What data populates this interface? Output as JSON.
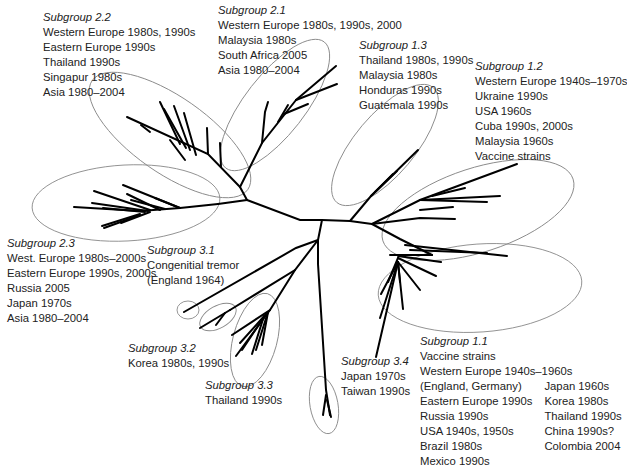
{
  "diagram": {
    "type": "unrooted phylogenetic tree",
    "subgroups": {
      "sg22": {
        "title": "Subgroup 2.2",
        "lines": [
          "Western Europe 1980s, 1990s",
          "Eastern Europe 1990s",
          "Thailand 1990s",
          "Singapur 1980s",
          "Asia 1980–2004"
        ]
      },
      "sg21": {
        "title": "Subgroup 2.1",
        "lines": [
          "Western Europe 1980s, 1990s, 2000",
          "Malaysia 1980s",
          "South Africa 2005",
          "Asia 1980–2004"
        ]
      },
      "sg13": {
        "title": "Subgroup 1.3",
        "lines": [
          "Thailand 1980s, 1990s",
          "Malaysia 1980s",
          "Honduras 1990s",
          "Guatemala 1990s"
        ]
      },
      "sg12": {
        "title": "Subgroup 1.2",
        "lines": [
          "Western Europe 1940s–1970s",
          "Ukraine 1990s",
          "USA 1960s",
          "Cuba 1990s, 2000s",
          "Malaysia 1960s",
          "Vaccine strains"
        ]
      },
      "sg23": {
        "title": "Subgroup 2.3",
        "lines": [
          "West. Europe 1980s–2000s",
          "Eastern Europe 1990s, 2000s",
          "Russia 2005",
          "Japan 1970s",
          "Asia 1980–2004"
        ]
      },
      "sg31": {
        "title": "Subgroup 3.1",
        "lines": [
          "Congenitial tremor",
          "(England 1964)"
        ]
      },
      "sg32": {
        "title": "Subgroup 3.2",
        "lines": [
          "Korea 1980s, 1990s"
        ]
      },
      "sg33": {
        "title": "Subgroup 3.3",
        "lines": [
          "Thailand 1990s"
        ]
      },
      "sg34": {
        "title": "Subgroup 3.4",
        "lines": [
          "Japan 1970s",
          "Taiwan 1990s"
        ]
      },
      "sg11": {
        "title": "Subgroup 1.1",
        "lines": [
          "Vaccine strains",
          "Western Europe 1940s–1960s"
        ],
        "col_left": [
          "(England, Germany)",
          "Eastern Europe 1990s",
          "Russia 1990s",
          "USA 1940s, 1950s",
          "Brazil 1980s",
          "Mexico 1990s"
        ],
        "col_right": [
          "Japan 1960s",
          "Korea 1980s",
          "Thailand 1990s",
          "China 1990s?",
          "Colombia 2004"
        ]
      }
    },
    "colors": {
      "branch": "#000000",
      "ellipse": "#8a8a8a",
      "text": "#222222"
    }
  }
}
